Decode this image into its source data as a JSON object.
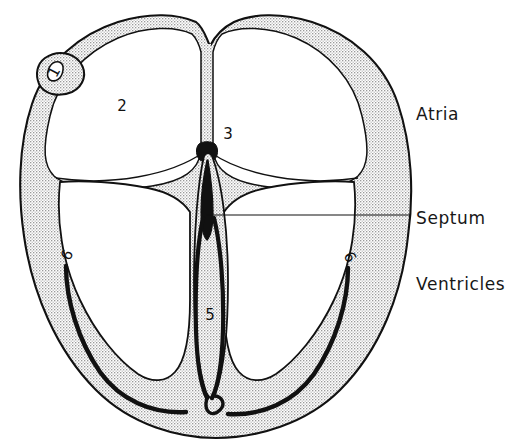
{
  "figure": {
    "background_color": "#ffffff",
    "ink_color": "#111111",
    "stipple_color": "#d8d8d8",
    "chamber_fill": "#ffffff"
  },
  "side_labels": {
    "atria": "Atria",
    "septum": "Septum",
    "ventricles": "Ventricles"
  },
  "numbered_callouts": [
    {
      "id": 1,
      "text": "1",
      "region": "auricle-appendage",
      "x": 54,
      "y": 72
    },
    {
      "id": 2,
      "text": "2",
      "region": "left-atrium-chamber",
      "x": 122,
      "y": 111
    },
    {
      "id": 3,
      "text": "3",
      "region": "right-atrium-chamber",
      "x": 228,
      "y": 139
    },
    {
      "id": 4,
      "text": "4",
      "region": "upper-septum",
      "x": 207,
      "y": 199
    },
    {
      "id": 5,
      "text": "5",
      "region": "lower-septum",
      "x": 210,
      "y": 315
    },
    {
      "id": 6,
      "text": "6",
      "region": "left-ventricle-wall",
      "x": 67,
      "y": 255
    },
    {
      "id": 7,
      "text": "6",
      "region": "right-ventricle-wall",
      "x": 350,
      "y": 257
    }
  ],
  "leader_lines": [
    {
      "name": "septum-leader",
      "from_x": 206,
      "from_y": 215,
      "to_x": 411,
      "to_y": 215
    }
  ]
}
